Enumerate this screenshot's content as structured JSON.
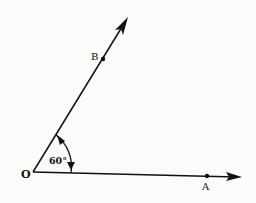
{
  "diagram": {
    "type": "angle",
    "vertex": {
      "label": "O",
      "x": 33,
      "y": 172
    },
    "rays": [
      {
        "name": "OA",
        "point_label": "A",
        "point": {
          "x": 207,
          "y": 176
        },
        "tip": {
          "x": 242,
          "y": 177
        }
      },
      {
        "name": "OB",
        "point_label": "B",
        "point": {
          "x": 103,
          "y": 59
        },
        "tip": {
          "x": 128,
          "y": 17
        }
      }
    ],
    "angle": {
      "label": "60°",
      "value_deg": 60
    },
    "colors": {
      "ink": "#111111",
      "background": "#fbfbf9"
    }
  }
}
